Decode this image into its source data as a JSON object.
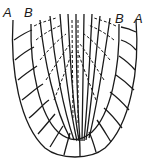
{
  "figure": {
    "labels": {
      "left_outer": "A",
      "left_inner": "B",
      "right_inner": "B",
      "right_outer": "A"
    },
    "colors": {
      "line": "#1a1a1a",
      "background": "#ffffff"
    }
  }
}
